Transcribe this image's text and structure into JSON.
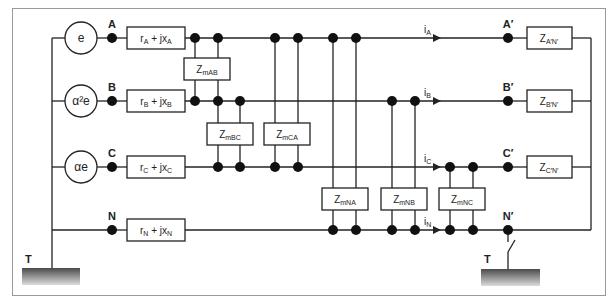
{
  "diagram": {
    "colors": {
      "line": "#222222",
      "frame": "#9a9a9a",
      "box_fill": "#ffffff",
      "ground_top": "#555555",
      "ground_bottom": "#e0e0e0"
    },
    "sources": [
      {
        "id": "A",
        "label": "e",
        "node": "A"
      },
      {
        "id": "B",
        "label": "α²e",
        "node": "B"
      },
      {
        "id": "C",
        "label": "αe",
        "node": "C"
      }
    ],
    "nodes_left": [
      "A",
      "B",
      "C",
      "N"
    ],
    "nodes_right": [
      "A′",
      "B′",
      "C′",
      "N′"
    ],
    "series_impedances": [
      {
        "main": "r",
        "sub1": "A",
        "plus": " + jx",
        "sub2": "A"
      },
      {
        "main": "r",
        "sub1": "B",
        "plus": " + jx",
        "sub2": "B"
      },
      {
        "main": "r",
        "sub1": "C",
        "plus": " + jx",
        "sub2": "C"
      },
      {
        "main": "r",
        "sub1": "N",
        "plus": " + jx",
        "sub2": "N"
      }
    ],
    "mutual_impedances": [
      {
        "main": "Z",
        "sub": "mAB"
      },
      {
        "main": "Z",
        "sub": "mBC"
      },
      {
        "main": "Z",
        "sub": "mCA"
      },
      {
        "main": "Z",
        "sub": "mNA"
      },
      {
        "main": "Z",
        "sub": "mNB"
      },
      {
        "main": "Z",
        "sub": "mNC"
      }
    ],
    "currents": [
      {
        "main": "i",
        "sub": "A"
      },
      {
        "main": "i",
        "sub": "B"
      },
      {
        "main": "i",
        "sub": "C"
      },
      {
        "main": "i",
        "sub": "N"
      }
    ],
    "load_impedances": [
      {
        "main": "Z",
        "sub": "A′N′"
      },
      {
        "main": "Z",
        "sub": "B′N′"
      },
      {
        "main": "Z",
        "sub": "C′N′"
      }
    ],
    "grounds": [
      {
        "label": "T",
        "side": "left"
      },
      {
        "label": "T",
        "side": "right",
        "switch": "open"
      }
    ]
  }
}
